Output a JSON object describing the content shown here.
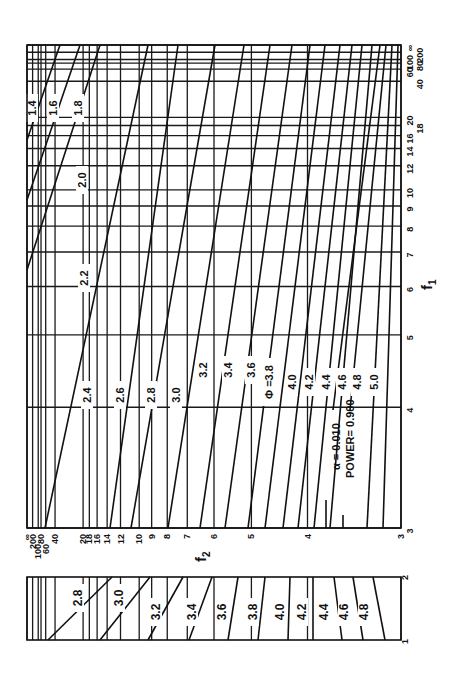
{
  "chart_data": {
    "type": "line",
    "alpha_label": "α = 0.010",
    "power_label": "POWER= 0.900",
    "phi_prefix": "Φ =",
    "x_axis": {
      "name": "f1",
      "orientation": "vertical (right edge), increasing upward",
      "ticks": [
        "3",
        "4",
        "5",
        "6",
        "7",
        "8",
        "9",
        "10",
        "12",
        "14",
        "16",
        "18",
        "20",
        "40",
        "60",
        "80",
        "100",
        "200",
        "∞"
      ]
    },
    "y_axis": {
      "name": "f2",
      "orientation": "horizontal (bottom edge), increasing leftward",
      "ticks": [
        "∞",
        "200",
        "100",
        "80",
        "60",
        "40",
        "20",
        "18",
        "16",
        "14",
        "12",
        "10",
        "9",
        "8",
        "7",
        "6",
        "5",
        "4",
        "3"
      ]
    },
    "lower_strip": {
      "f1_range": [
        "1",
        "2"
      ],
      "phi_curves": [
        "2.8",
        "3.0",
        "3.2",
        "3.4",
        "3.6",
        "3.8",
        "4.0",
        "4.2",
        "4.4",
        "4.6",
        "4.8"
      ]
    },
    "phi_curves": [
      "1.4",
      "1.6",
      "1.8",
      "2.0",
      "2.2",
      "2.4",
      "2.6",
      "2.8",
      "3.0",
      "3.2",
      "3.4",
      "3.6",
      "3.8",
      "4.0",
      "4.2",
      "4.4",
      "4.6",
      "4.8",
      "5.0"
    ],
    "grid": true,
    "legend_position": "lower right inside main panel"
  },
  "labels": {
    "f1_axis": "f",
    "f1_sub": "1",
    "f2_axis": "f",
    "f2_sub": "2"
  },
  "main_ticks_f1": [
    {
      "t": "3",
      "v": 3
    },
    {
      "t": "4",
      "v": 4
    },
    {
      "t": "5",
      "v": 5
    },
    {
      "t": "6",
      "v": 6
    },
    {
      "t": "7",
      "v": 7
    },
    {
      "t": "8",
      "v": 8
    },
    {
      "t": "9",
      "v": 9
    },
    {
      "t": "10",
      "v": 10
    },
    {
      "t": "12",
      "v": 12
    },
    {
      "t": "14",
      "v": 14
    },
    {
      "t": "16",
      "v": 16
    },
    {
      "t": "18",
      "v": 18
    },
    {
      "t": "20",
      "v": 20
    },
    {
      "t": "40",
      "v": 40
    },
    {
      "t": "60",
      "v": 60
    },
    {
      "t": "80",
      "v": 80
    },
    {
      "t": "100",
      "v": 100
    },
    {
      "t": "200",
      "v": 200
    },
    {
      "t": "∞",
      "v": 1000000000.0
    }
  ],
  "main_ticks_f2": [
    {
      "t": "∞",
      "v": 1000000000.0
    },
    {
      "t": "200",
      "v": 200
    },
    {
      "t": "100",
      "v": 100
    },
    {
      "t": "80",
      "v": 80
    },
    {
      "t": "60",
      "v": 60
    },
    {
      "t": "40",
      "v": 40
    },
    {
      "t": "20",
      "v": 20
    },
    {
      "t": "18",
      "v": 18
    },
    {
      "t": "16",
      "v": 16
    },
    {
      "t": "14",
      "v": 14
    },
    {
      "t": "12",
      "v": 12
    },
    {
      "t": "10",
      "v": 10
    },
    {
      "t": "9",
      "v": 9
    },
    {
      "t": "8",
      "v": 8
    },
    {
      "t": "7",
      "v": 7
    },
    {
      "t": "6",
      "v": 6
    },
    {
      "t": "5",
      "v": 5
    },
    {
      "t": "4",
      "v": 4
    },
    {
      "t": "3",
      "v": 3
    }
  ],
  "main_curves": [
    {
      "phi": "1.4",
      "a": [
        27,
        140
      ],
      "b": [
        60,
        45
      ],
      "lx": 36,
      "ly": 108
    },
    {
      "phi": "1.6",
      "a": [
        27,
        200
      ],
      "b": [
        80,
        45
      ],
      "lx": 57,
      "ly": 108
    },
    {
      "phi": "1.8",
      "a": [
        27,
        270
      ],
      "b": [
        100,
        45
      ],
      "lx": 82,
      "ly": 108
    },
    {
      "phi": "2.0",
      "a": [
        45,
        528
      ],
      "b": [
        148,
        45
      ],
      "lx": 86,
      "ly": 180
    },
    {
      "phi": "2.2",
      "a": [
        110,
        528
      ],
      "b": [
        178,
        45
      ],
      "lx": 88,
      "ly": 278
    },
    {
      "phi": "2.4",
      "a": [
        131,
        528
      ],
      "b": [
        215,
        45
      ],
      "lx": 91,
      "ly": 395
    },
    {
      "phi": "2.6",
      "a": [
        168,
        528
      ],
      "b": [
        244,
        45
      ],
      "lx": 124,
      "ly": 395
    },
    {
      "phi": "2.8",
      "a": [
        200,
        528
      ],
      "b": [
        270,
        45
      ],
      "lx": 155,
      "ly": 395
    },
    {
      "phi": "3.0",
      "a": [
        225,
        528
      ],
      "b": [
        292,
        45
      ],
      "lx": 180,
      "ly": 395
    },
    {
      "phi": "3.2",
      "a": [
        248,
        528
      ],
      "b": [
        310,
        45
      ],
      "lx": 207,
      "ly": 370
    },
    {
      "phi": "3.4",
      "a": [
        265,
        528
      ],
      "b": [
        325,
        45
      ],
      "lx": 232,
      "ly": 370
    },
    {
      "phi": "3.6",
      "a": [
        283,
        528
      ],
      "b": [
        340,
        45
      ],
      "lx": 255,
      "ly": 370
    },
    {
      "phi": "3.8",
      "a": [
        298,
        528
      ],
      "b": [
        352,
        45
      ],
      "lx": 273,
      "ly": 382
    },
    {
      "phi": "4.0",
      "a": [
        314,
        528
      ],
      "b": [
        362,
        45
      ],
      "lx": 296,
      "ly": 382
    },
    {
      "phi": "4.2",
      "a": [
        330,
        528
      ],
      "b": [
        372,
        45
      ],
      "lx": 313,
      "ly": 382
    },
    {
      "phi": "4.4",
      "a": [
        333,
        410
      ],
      "b": [
        380,
        45
      ],
      "lx": 330,
      "ly": 382
    },
    {
      "phi": "4.6",
      "a": [
        350,
        410
      ],
      "b": [
        386,
        45
      ],
      "lx": 346,
      "ly": 382
    },
    {
      "phi": "4.8",
      "a": [
        367,
        528
      ],
      "b": [
        392,
        45
      ],
      "lx": 361,
      "ly": 382
    },
    {
      "phi": "5.0",
      "a": [
        383,
        528
      ],
      "b": [
        398,
        45
      ],
      "lx": 378,
      "ly": 382
    }
  ],
  "strip_curves": [
    {
      "phi": "2.8",
      "a": [
        48,
        640
      ],
      "b": [
        112,
        577
      ],
      "lx": 82,
      "ly": 598
    },
    {
      "phi": "3.0",
      "a": [
        100,
        640
      ],
      "b": [
        150,
        577
      ],
      "lx": 123,
      "ly": 598
    },
    {
      "phi": "3.2",
      "a": [
        148,
        640
      ],
      "b": [
        183,
        577
      ],
      "lx": 160,
      "ly": 612
    },
    {
      "phi": "3.4",
      "a": [
        189,
        640
      ],
      "b": [
        212,
        577
      ],
      "lx": 196,
      "ly": 612
    },
    {
      "phi": "3.6",
      "a": [
        228,
        640
      ],
      "b": [
        238,
        577
      ],
      "lx": 226,
      "ly": 612
    },
    {
      "phi": "3.8",
      "a": [
        258,
        640
      ],
      "b": [
        265,
        577
      ],
      "lx": 257,
      "ly": 612
    },
    {
      "phi": "4.0",
      "a": [
        288,
        640
      ],
      "b": [
        290,
        577
      ],
      "lx": 284,
      "ly": 612
    },
    {
      "phi": "4.2",
      "a": [
        313,
        640
      ],
      "b": [
        313,
        577
      ],
      "lx": 306,
      "ly": 612
    },
    {
      "phi": "4.4",
      "a": [
        342,
        640
      ],
      "b": [
        334,
        577
      ],
      "lx": 328,
      "ly": 612
    },
    {
      "phi": "4.6",
      "a": [
        363,
        640
      ],
      "b": [
        353,
        577
      ],
      "lx": 348,
      "ly": 612
    },
    {
      "phi": "4.8",
      "a": [
        385,
        640
      ],
      "b": [
        373,
        577
      ],
      "lx": 368,
      "ly": 612
    }
  ]
}
